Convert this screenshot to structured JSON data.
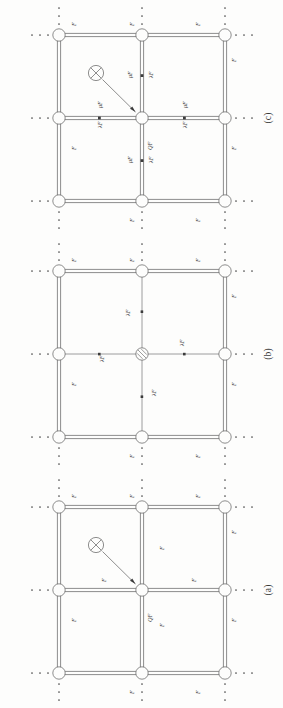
{
  "figure": {
    "kind": "network-lattice-diagram",
    "orientation": "rotated-90-ccw",
    "page_background": "#fdfdfc",
    "ink_color": "#3b3b3b",
    "panels": [
      {
        "id": "c",
        "caption": "(c)",
        "center_node": "crossed-circle-source",
        "source_marker": "crossed-circle",
        "diagonal_label": "QF",
        "outer_edge_label": "F",
        "inner_edge_labels": [
          "μF",
          "λF"
        ],
        "edge_labels": {
          "top_left": "F",
          "top_right": "F",
          "left_upper": "F",
          "left_lower": "F",
          "right_upper": "F",
          "right_lower": "F",
          "bottom_left": "F",
          "bottom_right": "F"
        },
        "spoke_labels": [
          {
            "dir": "up",
            "near": "μF",
            "far": "λF"
          },
          {
            "dir": "left",
            "near": "μF",
            "far": "λF"
          },
          {
            "dir": "right",
            "near": "μF",
            "far": "λF"
          },
          {
            "dir": "down",
            "near": "μF",
            "far": "λF"
          }
        ],
        "ellipsis_glyph": "·"
      },
      {
        "id": "b",
        "caption": "(b)",
        "center_node": "hatched-circle",
        "source_marker": "none",
        "diagonal_label": "",
        "outer_edge_label": "F",
        "inner_edge_labels": [
          "λF"
        ],
        "edge_labels": {
          "top_left": "F",
          "top_right": "F",
          "left_upper": "F",
          "left_lower": "F",
          "right_upper": "F",
          "right_lower": "F",
          "bottom_left": "F",
          "bottom_right": "F"
        },
        "spoke_labels": [
          {
            "dir": "up",
            "near": "λF",
            "far": ""
          },
          {
            "dir": "left",
            "near": "λF",
            "far": ""
          },
          {
            "dir": "right",
            "near": "λF",
            "far": ""
          },
          {
            "dir": "down",
            "near": "λF",
            "far": ""
          }
        ],
        "ellipsis_glyph": "·"
      },
      {
        "id": "a",
        "caption": "(a)",
        "center_node": "plain-circle",
        "source_marker": "crossed-circle",
        "diagonal_label": "QF",
        "outer_edge_label": "F",
        "inner_edge_labels": [
          "F"
        ],
        "edge_labels": {
          "top_left": "F",
          "top_right": "F",
          "left_upper": "F",
          "left_lower": "F",
          "right_upper": "F",
          "right_lower": "F",
          "bottom_left": "F",
          "bottom_right": "F"
        },
        "spoke_labels": [
          {
            "dir": "up",
            "near": "F",
            "far": ""
          },
          {
            "dir": "left",
            "near": "F",
            "far": ""
          },
          {
            "dir": "right",
            "near": "F",
            "far": ""
          },
          {
            "dir": "down",
            "near": "F",
            "far": ""
          }
        ],
        "ellipsis_glyph": "·"
      }
    ]
  }
}
